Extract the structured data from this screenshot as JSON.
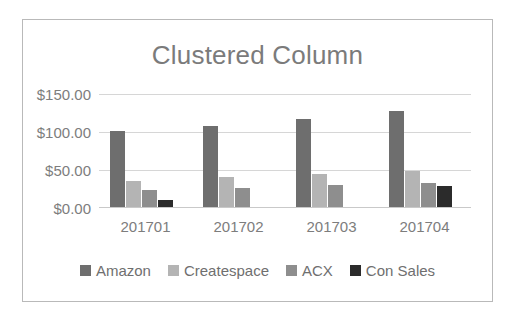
{
  "chart_data": {
    "type": "bar",
    "title": "Clustered Column",
    "xlabel": "",
    "ylabel": "",
    "categories": [
      "201701",
      "201702",
      "201703",
      "201704"
    ],
    "series": [
      {
        "name": "Amazon",
        "color": "#6e6e6e",
        "values": [
          100,
          107,
          116,
          126
        ]
      },
      {
        "name": "Createspace",
        "color": "#b4b4b4",
        "values": [
          34,
          40,
          44,
          48
        ]
      },
      {
        "name": "ACX",
        "color": "#8e8e8e",
        "values": [
          22,
          25,
          29,
          32
        ]
      },
      {
        "name": "Con Sales",
        "color": "#2b2b2b",
        "values": [
          9,
          0,
          0,
          27
        ]
      }
    ],
    "ylim": [
      0,
      150
    ],
    "yticks": [
      0,
      50,
      100,
      150
    ],
    "ytick_labels": [
      "$0.00",
      "$50.00",
      "$100.00",
      "$150.00"
    ],
    "grid": true,
    "legend_position": "bottom"
  }
}
